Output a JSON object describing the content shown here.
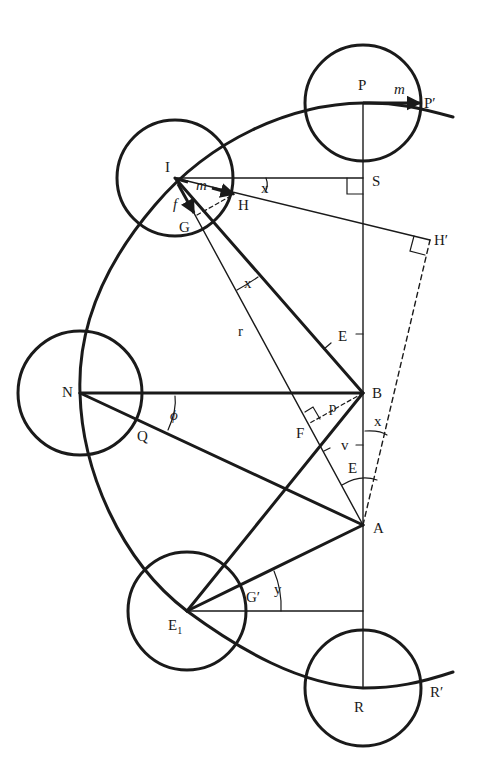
{
  "diagram": {
    "type": "geometric orbital construction",
    "colors": {
      "ink": "#1a1a1a",
      "background": "#ffffff"
    },
    "labels": {
      "P": "P",
      "P_prime": "P′",
      "m_top": "m",
      "I": "I",
      "S": "S",
      "m_mid": "m",
      "x_top": "x",
      "H": "H",
      "f": "f",
      "G": "G",
      "H_prime": "H′",
      "x_mid": "x",
      "r": "r",
      "E_mid": "E",
      "N": "N",
      "B": "B",
      "phi": "ϕ",
      "p": "p",
      "F": "F",
      "Q": "Q",
      "x_low": "x",
      "v": "v",
      "E_low": "E",
      "A": "A",
      "G_prime": "G′",
      "y": "y",
      "E1": "E",
      "E1_sub": "1",
      "R": "R",
      "R_prime": "R′"
    },
    "points": {
      "P": [
        363,
        103
      ],
      "I": [
        175,
        178
      ],
      "N": [
        80,
        393
      ],
      "E1": [
        187,
        611
      ],
      "R": [
        363,
        688
      ],
      "S": [
        363,
        178
      ],
      "B": [
        363,
        393
      ],
      "A": [
        363,
        525
      ],
      "H": [
        235,
        193
      ],
      "H_prime": [
        430,
        240
      ],
      "G": [
        197,
        215
      ],
      "F": [
        312,
        421
      ],
      "Q": [
        140,
        420
      ]
    },
    "circles": [
      {
        "name": "P",
        "cx": 363,
        "cy": 103,
        "r": 58
      },
      {
        "name": "I",
        "cx": 175,
        "cy": 178,
        "r": 58
      },
      {
        "name": "N",
        "cx": 80,
        "cy": 393,
        "r": 62
      },
      {
        "name": "E1",
        "cx": 187,
        "cy": 611,
        "r": 59
      },
      {
        "name": "R",
        "cx": 363,
        "cy": 688,
        "r": 58
      }
    ]
  }
}
